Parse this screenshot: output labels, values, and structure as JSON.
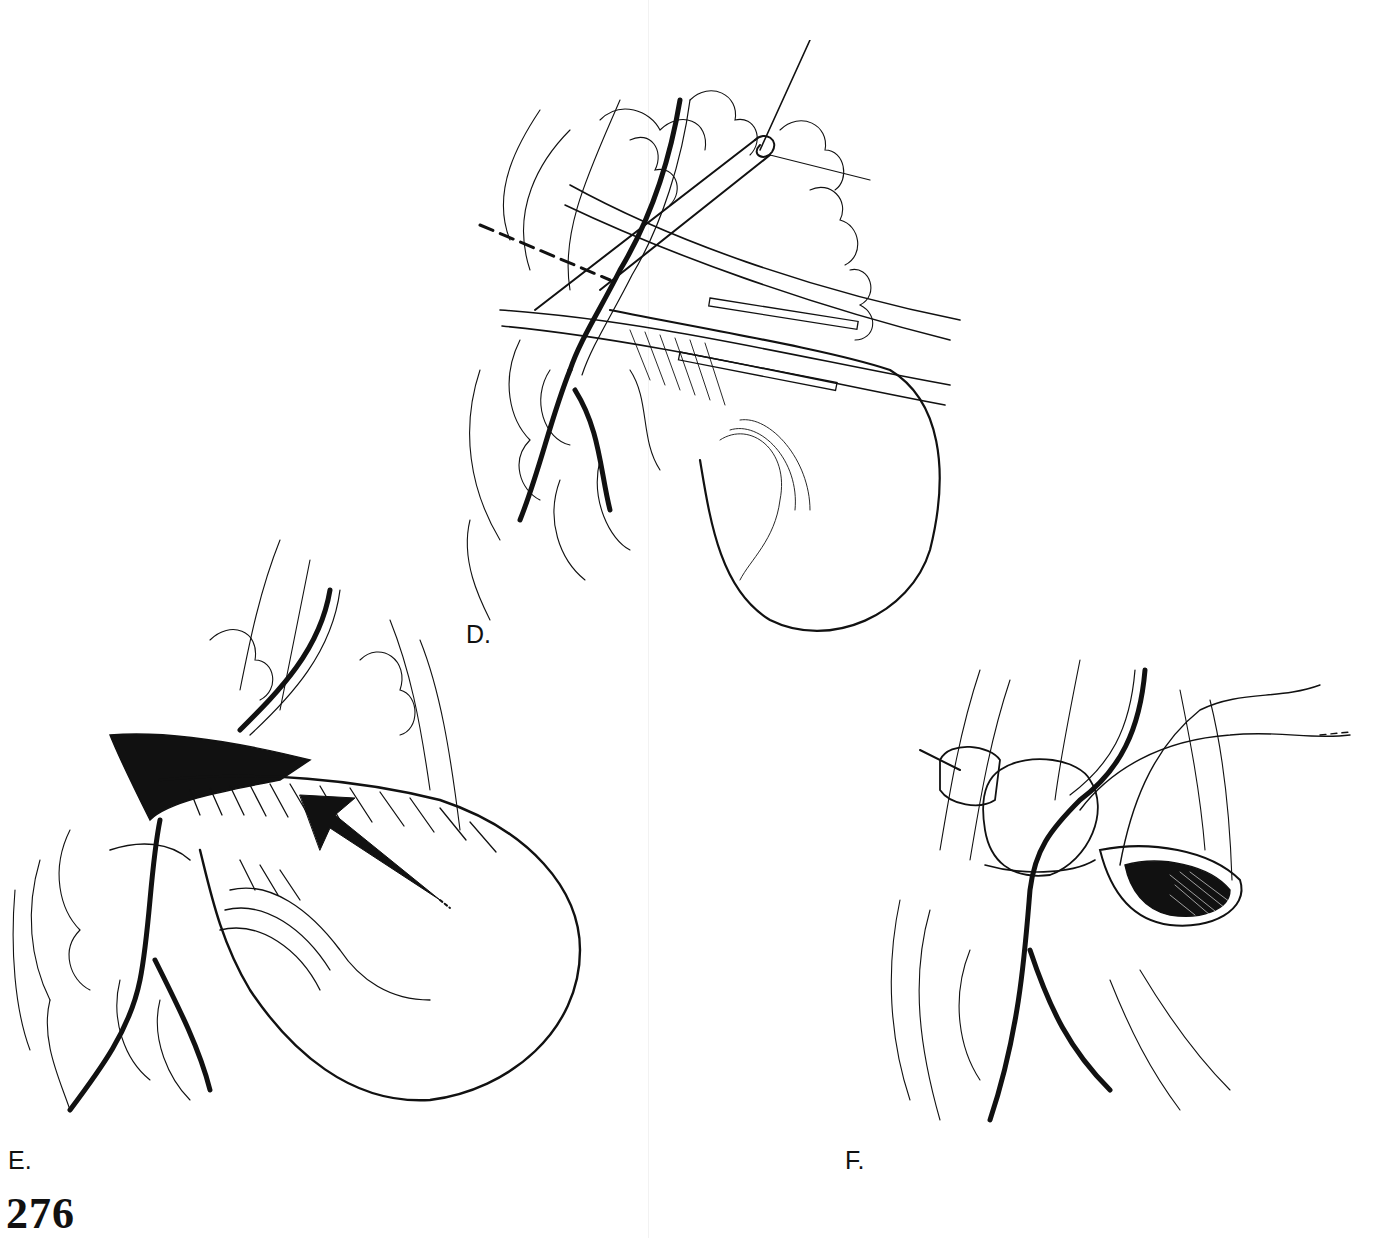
{
  "page": {
    "page_number": "276"
  },
  "figures": [
    {
      "id": "D",
      "label": "D.",
      "illustration": "surgical-line-drawing-ligation-with-clamp-and-suture-tie"
    },
    {
      "id": "E",
      "label": "E.",
      "illustration": "surgical-line-drawing-sac-with-direction-arrow"
    },
    {
      "id": "F",
      "label": "F.",
      "illustration": "surgical-line-drawing-closure-with-sutures-and-open-sac"
    }
  ],
  "colors": {
    "ink": "#111111",
    "paper": "#ffffff"
  }
}
